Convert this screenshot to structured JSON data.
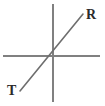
{
  "figure": {
    "background_color": "#ffffff",
    "width": 105,
    "height": 106
  },
  "axes": {
    "color": "#808080",
    "stroke_width": 2,
    "horizontal": {
      "name": "horizontal-axis",
      "x1": 3,
      "y1": 56,
      "x2": 100,
      "y2": 56
    },
    "vertical": {
      "name": "vertical-axis",
      "x1": 53,
      "y1": 4,
      "x2": 53,
      "y2": 102
    },
    "origin": {
      "x": 53,
      "y": 56
    }
  },
  "ray": {
    "name": "line-TR",
    "color": "#6e6e6e",
    "stroke_width": 1.6,
    "x1": 20,
    "y1": 91,
    "x2": 83,
    "y2": 14
  },
  "labels": {
    "upper_right": {
      "text": "R",
      "x": 86,
      "y": 8,
      "color": "#2b2b2b"
    },
    "lower_left": {
      "text": "T",
      "x": 7,
      "y": 84,
      "color": "#2b2b2b"
    }
  }
}
